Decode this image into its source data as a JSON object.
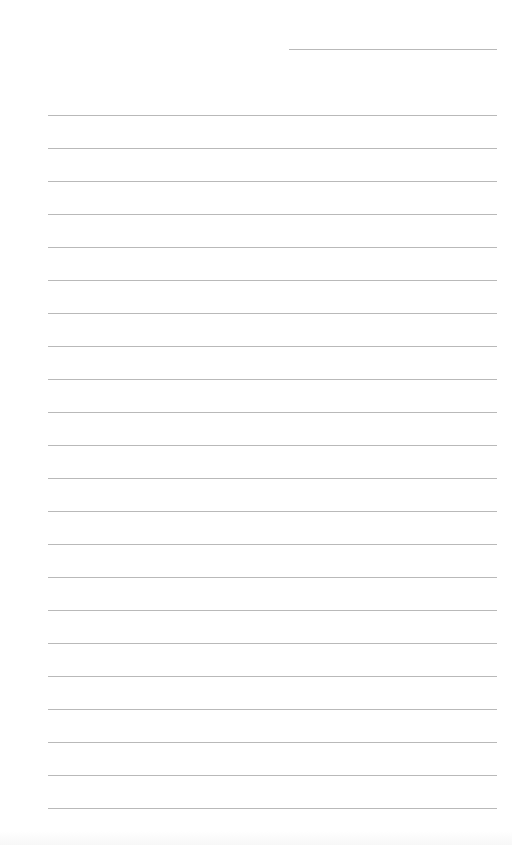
{
  "page": {
    "type": "blank lined sheet",
    "background_color": "#ffffff",
    "rule_color": "#b9b9b9",
    "header_line": {
      "x": 289,
      "y": 49,
      "width": 208
    },
    "ruled_lines": {
      "count": 22,
      "x": 48,
      "width": 449,
      "first_y": 115,
      "spacing": 33
    }
  }
}
